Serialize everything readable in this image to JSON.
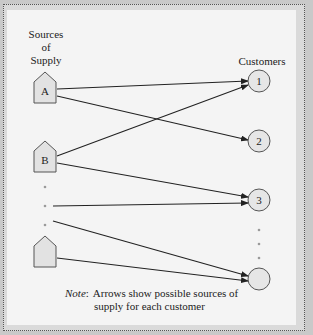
{
  "diagram": {
    "sources_label": [
      "Sources",
      "of",
      "Supply"
    ],
    "customers_label": "Customers",
    "sources": [
      {
        "id": "A",
        "label": "A"
      },
      {
        "id": "B",
        "label": "B"
      },
      {
        "id": "last",
        "label": ""
      }
    ],
    "customers": [
      {
        "id": "1",
        "label": "1"
      },
      {
        "id": "2",
        "label": "2"
      },
      {
        "id": "3",
        "label": "3"
      },
      {
        "id": "last",
        "label": ""
      }
    ],
    "arrows": [
      {
        "from": "A",
        "to": "1"
      },
      {
        "from": "A",
        "to": "2"
      },
      {
        "from": "B",
        "to": "1"
      },
      {
        "from": "B",
        "to": "3"
      },
      {
        "from": "ellipsis",
        "to": "3"
      },
      {
        "from": "ellipsis",
        "to": "last"
      },
      {
        "from": "last",
        "to": "last"
      }
    ],
    "note": {
      "prefix": "Note",
      "colon": ":",
      "line1": "Arrows show possible sources of",
      "line2": "supply for each customer"
    },
    "colors": {
      "outer_bg": "#c9c9c9",
      "panel_bg": "#f4f4f4",
      "node_fill": "#e2e2e2",
      "line": "#222222",
      "dots": "#9a9a9a"
    }
  }
}
